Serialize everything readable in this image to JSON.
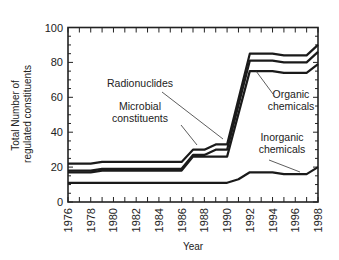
{
  "chart_data": {
    "type": "line",
    "title": "",
    "xlabel": "Year",
    "ylabel": "Total Number of regulated constituents",
    "ylabel_lines": [
      "Total Number of",
      "regulated constituents"
    ],
    "xlim": [
      1976,
      1998
    ],
    "ylim": [
      0,
      100
    ],
    "x_ticks": [
      1976,
      1978,
      1980,
      1982,
      1984,
      1986,
      1988,
      1990,
      1992,
      1994,
      1996,
      1998
    ],
    "y_ticks": [
      0,
      20,
      40,
      60,
      80,
      100
    ],
    "grid": false,
    "legend": "none (direct annotations)",
    "series": [
      {
        "name": "Radionuclides (cumulative top line)",
        "x": [
          1976,
          1978,
          1979,
          1986,
          1987,
          1988,
          1989,
          1990,
          1992,
          1994,
          1995,
          1997,
          1998
        ],
        "values": [
          22,
          22,
          23,
          23,
          30,
          30,
          33,
          33,
          85,
          85,
          84,
          84,
          90
        ]
      },
      {
        "name": "Microbial constituents (cumulative)",
        "x": [
          1976,
          1978,
          1979,
          1986,
          1987,
          1988,
          1989,
          1990,
          1992,
          1994,
          1995,
          1997,
          1998
        ],
        "values": [
          18,
          18,
          19,
          19,
          27,
          27,
          30,
          30,
          81,
          81,
          80,
          80,
          86
        ]
      },
      {
        "name": "Organic chemicals (cumulative)",
        "x": [
          1976,
          1978,
          1979,
          1986,
          1987,
          1988,
          1990,
          1992,
          1994,
          1995,
          1997,
          1998
        ],
        "values": [
          17,
          17,
          18,
          18,
          26,
          26,
          26,
          75,
          75,
          74,
          74,
          79
        ]
      },
      {
        "name": "Inorganic chemicals",
        "x": [
          1976,
          1990,
          1991,
          1992,
          1994,
          1995,
          1997,
          1998
        ],
        "values": [
          11,
          11,
          13,
          17,
          17,
          16,
          16,
          20
        ]
      }
    ],
    "annotations": [
      {
        "text": "Radionuclides",
        "lines": [
          "Radionuclides"
        ],
        "x": 140,
        "y": 87,
        "pointer": [
          [
            162,
            92
          ],
          [
            223,
            139
          ]
        ]
      },
      {
        "text": "Microbial constituents",
        "lines": [
          "Microbial",
          "constituents"
        ],
        "x": 140,
        "y": 110,
        "pointer": [
          [
            181,
            125
          ],
          [
            197,
            145
          ]
        ]
      },
      {
        "text": "Organic chemicals",
        "lines": [
          "Organic",
          "chemicals"
        ],
        "x": 291,
        "y": 98,
        "pointer": [
          [
            256,
            71
          ],
          [
            273,
            94
          ]
        ]
      },
      {
        "text": "Inorganic chemicals",
        "lines": [
          "Inorganic",
          "chemicals"
        ],
        "x": 282,
        "y": 141,
        "pointer": [
          [
            269,
            160
          ],
          [
            300,
            172
          ]
        ]
      }
    ]
  }
}
